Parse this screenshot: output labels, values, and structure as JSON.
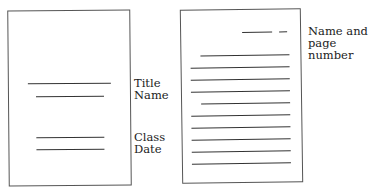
{
  "title_page": {
    "labels": {
      "title": "Title",
      "name": "Name",
      "class": "Class",
      "date": "Date"
    }
  },
  "text_page": {
    "header_label_line1": "Name and",
    "header_label_line2": "page number",
    "body_line_count": 10
  }
}
